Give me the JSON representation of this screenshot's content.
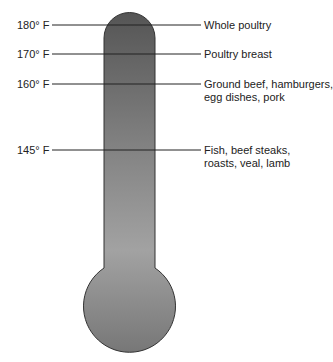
{
  "diagram": {
    "title": "",
    "type": "thermometer",
    "markers": [
      {
        "temp": "180° F",
        "label_lines": [
          "Whole poultry"
        ],
        "y": 25
      },
      {
        "temp": "170° F",
        "label_lines": [
          "Poultry breast"
        ],
        "y": 54
      },
      {
        "temp": "160° F",
        "label_lines": [
          "Ground beef, hamburgers,",
          "egg dishes, pork"
        ],
        "y": 84
      },
      {
        "temp": "145° F",
        "label_lines": [
          "Fish, beef steaks,",
          "roasts, veal, lamb"
        ],
        "y": 150
      }
    ],
    "colors": {
      "top": "#5a5a5a",
      "mid": "#9a9a9a",
      "bottom": "#7e7e7e",
      "outline": "#333333",
      "line": "#222222"
    }
  }
}
